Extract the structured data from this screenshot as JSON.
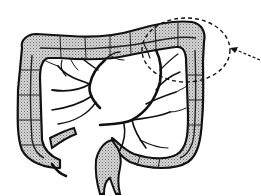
{
  "figure": {
    "highlight": "splenic flexure",
    "highlight_style": "dashed ellipse with arrow",
    "colors": {
      "background": "#ffffff",
      "outline": "#111111",
      "shading": "#b8b8b8",
      "vessels": "#111111"
    }
  }
}
